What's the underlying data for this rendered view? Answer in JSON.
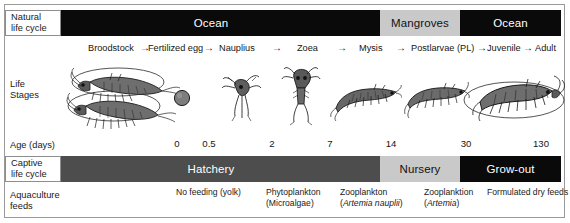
{
  "natural": {
    "label_line1": "Natural",
    "label_line2": "life cycle",
    "segments": [
      {
        "label": "Ocean",
        "habitat": "ocean",
        "color": "#0a0a0a",
        "left": 42,
        "width": 338
      },
      {
        "label": "Mangroves",
        "habitat": "mangroves",
        "color": "#c9c9c9",
        "left": 380,
        "width": 80
      },
      {
        "label": "Ocean",
        "habitat": "ocean",
        "color": "#0a0a0a",
        "left": 460,
        "width": 101
      }
    ]
  },
  "life_stages": {
    "label_line1": "Life",
    "label_line2": "Stages",
    "arrow_glyph": "→",
    "names": [
      {
        "label": "Broodstock",
        "left": 88
      },
      {
        "label": "Fertilized egg",
        "left": 148
      },
      {
        "label": "Nauplius",
        "left": 219
      },
      {
        "label": "Zoea",
        "left": 297
      },
      {
        "label": "Mysis",
        "left": 359
      },
      {
        "label": "Postlarvae (PL)",
        "left": 411
      },
      {
        "label": "Juvenile",
        "left": 487
      },
      {
        "label": "Adult",
        "left": 535
      }
    ],
    "arrows": [
      140,
      204,
      272,
      337,
      396,
      477,
      523
    ],
    "organisms": [
      {
        "name": "broodstock-shrimp-pair",
        "stage": "Broodstock"
      },
      {
        "name": "fertilized-egg",
        "stage": "Fertilized egg"
      },
      {
        "name": "nauplius-larva",
        "stage": "Nauplius"
      },
      {
        "name": "zoea-larva",
        "stage": "Zoea"
      },
      {
        "name": "mysis-larva",
        "stage": "Mysis"
      },
      {
        "name": "postlarvae-shrimp",
        "stage": "Postlarvae (PL)"
      },
      {
        "name": "juvenile-shrimp",
        "stage": "Juvenile"
      },
      {
        "name": "adult-shrimp",
        "stage": "Adult"
      }
    ]
  },
  "age_axis": {
    "label": "Age (days)",
    "unit": "days",
    "ticks": [
      {
        "value": "0",
        "left": 177
      },
      {
        "value": "0.5",
        "left": 209
      },
      {
        "value": "2",
        "left": 272
      },
      {
        "value": "7",
        "left": 330
      },
      {
        "value": "14",
        "left": 391
      },
      {
        "value": "30",
        "left": 466
      },
      {
        "value": "130",
        "left": 541
      }
    ]
  },
  "captive": {
    "label_line1": "Captive",
    "label_line2": "life cycle",
    "segments": [
      {
        "label": "Hatchery",
        "phase": "hatchery",
        "color": "#4d4d4d",
        "left": 42,
        "width": 338
      },
      {
        "label": "Nursery",
        "phase": "nursery",
        "color": "#c9c9c9",
        "left": 380,
        "width": 80
      },
      {
        "label": "Grow-out",
        "phase": "grow-out",
        "color": "#0a0a0a",
        "left": 460,
        "width": 101
      }
    ]
  },
  "feeds": {
    "label_line1": "Aquaculture",
    "label_line2": "feeds",
    "items": [
      {
        "line1": "No feeding (yolk)",
        "line2": "",
        "italic2": "",
        "left": 176
      },
      {
        "line1": "Phytoplankton",
        "line2": "(Microalgae)",
        "italic2": "",
        "left": 266
      },
      {
        "line1": "Zooplankton",
        "line2_pre": "(",
        "italic2": "Artemia nauplii",
        "line2_post": ")",
        "left": 340
      },
      {
        "line1": "Zooplanktion",
        "line2_pre": "(",
        "italic2": "Artemia",
        "line2_post": ")",
        "left": 424
      },
      {
        "line1": "Formulated dry feeds",
        "line2": "",
        "italic2": "",
        "left": 487
      }
    ]
  },
  "colors": {
    "ocean": "#0a0a0a",
    "mangroves": "#c9c9c9",
    "hatchery": "#4d4d4d",
    "nursery": "#c9c9c9",
    "growout": "#0a0a0a",
    "frame": "#9a9a9a",
    "text": "#1a1a1a"
  }
}
